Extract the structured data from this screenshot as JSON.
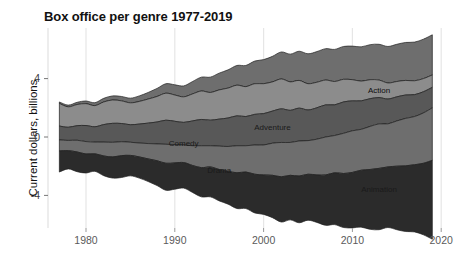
{
  "chart_data": {
    "type": "area",
    "title": "Box office per genre 1977-2019",
    "xlabel": "",
    "ylabel": "Current dollars, billions",
    "xlim": [
      1977,
      2020
    ],
    "ylim": [
      -6.0,
      6.8
    ],
    "xticks": [
      1980,
      1990,
      2000,
      2010,
      2020
    ],
    "yticks": [
      4,
      0,
      -4
    ],
    "grid": "vertical",
    "legend": "inline-labels",
    "stacking": "streamgraph-wiggle",
    "x": [
      1977,
      1978,
      1979,
      1980,
      1981,
      1982,
      1983,
      1984,
      1985,
      1986,
      1987,
      1988,
      1989,
      1990,
      1991,
      1992,
      1993,
      1994,
      1995,
      1996,
      1997,
      1998,
      1999,
      2000,
      2001,
      2002,
      2003,
      2004,
      2005,
      2006,
      2007,
      2008,
      2009,
      2010,
      2011,
      2012,
      2013,
      2014,
      2015,
      2016,
      2017,
      2018,
      2019
    ],
    "series": [
      {
        "name": "Action",
        "color": "#2b2b2b",
        "label_x": 2013,
        "label_y": 3.0,
        "values": [
          1.45,
          1.25,
          1.35,
          1.3,
          1.2,
          1.35,
          1.45,
          1.5,
          1.4,
          1.45,
          1.55,
          1.7,
          1.85,
          1.8,
          1.75,
          1.85,
          2.0,
          2.05,
          2.15,
          2.25,
          2.45,
          2.5,
          2.65,
          2.7,
          2.9,
          3.1,
          3.05,
          3.2,
          3.15,
          3.25,
          3.45,
          3.55,
          3.7,
          3.8,
          3.9,
          4.1,
          4.2,
          4.15,
          4.35,
          4.5,
          4.6,
          4.9,
          5.4
        ]
      },
      {
        "name": "Adventure",
        "color": "#6e6e6e",
        "label_x": 2001,
        "label_y": 0.45,
        "values": [
          0.75,
          0.7,
          0.8,
          0.85,
          0.8,
          0.95,
          1.0,
          0.95,
          0.9,
          0.95,
          1.05,
          1.15,
          1.3,
          1.25,
          1.2,
          1.35,
          1.5,
          1.45,
          1.6,
          1.7,
          1.85,
          1.8,
          2.0,
          2.05,
          2.2,
          2.35,
          2.25,
          2.4,
          2.3,
          2.45,
          2.6,
          2.55,
          2.75,
          2.85,
          2.8,
          2.95,
          3.05,
          2.95,
          3.1,
          3.25,
          3.3,
          3.45,
          3.6
        ]
      },
      {
        "name": "Comedy",
        "color": "#585858",
        "label_x": 1991,
        "label_y": -0.6,
        "values": [
          0.95,
          0.9,
          1.0,
          1.1,
          1.05,
          1.2,
          1.3,
          1.25,
          1.2,
          1.3,
          1.4,
          1.5,
          1.65,
          1.6,
          1.55,
          1.7,
          1.8,
          1.75,
          1.85,
          1.95,
          2.05,
          2.0,
          2.1,
          2.15,
          2.2,
          2.3,
          2.2,
          2.25,
          2.1,
          2.15,
          2.2,
          2.1,
          2.15,
          2.05,
          1.95,
          1.9,
          1.8,
          1.7,
          1.65,
          1.6,
          1.5,
          1.45,
          1.4
        ]
      },
      {
        "name": "Drama",
        "color": "#8c8c8c",
        "label_x": 1995,
        "label_y": -2.45,
        "values": [
          1.55,
          1.4,
          1.45,
          1.5,
          1.45,
          1.55,
          1.6,
          1.55,
          1.5,
          1.55,
          1.65,
          1.75,
          1.85,
          1.8,
          1.75,
          1.85,
          1.95,
          1.9,
          2.0,
          2.05,
          2.1,
          2.05,
          2.1,
          2.05,
          2.0,
          2.05,
          1.95,
          1.9,
          1.8,
          1.75,
          1.7,
          1.6,
          1.55,
          1.45,
          1.35,
          1.3,
          1.2,
          1.1,
          1.05,
          1.0,
          0.95,
          0.9,
          0.85
        ]
      },
      {
        "name": "Animation",
        "color": "#6e6e6e",
        "label_x": 2013,
        "label_y": -3.75,
        "values": [
          0.1,
          0.12,
          0.15,
          0.18,
          0.2,
          0.25,
          0.28,
          0.3,
          0.32,
          0.38,
          0.45,
          0.55,
          0.65,
          0.7,
          0.75,
          0.85,
          0.95,
          1.05,
          1.15,
          1.25,
          1.35,
          1.45,
          1.55,
          1.65,
          1.75,
          1.85,
          1.9,
          2.0,
          2.05,
          2.1,
          2.15,
          2.2,
          2.25,
          2.3,
          2.35,
          2.4,
          2.45,
          2.5,
          2.55,
          2.6,
          2.65,
          2.7,
          2.75
        ]
      }
    ]
  }
}
